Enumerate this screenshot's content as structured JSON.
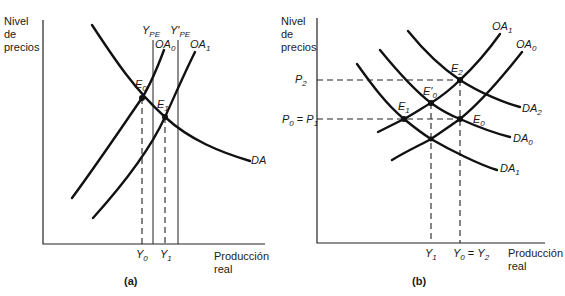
{
  "panel_a": {
    "caption": "(a)",
    "y_axis_label": [
      "Nivel",
      "de",
      "precios"
    ],
    "x_axis_label": [
      "Producción",
      "real"
    ],
    "curves": {
      "DA": "DA",
      "OA0": "OA",
      "OA0_sub": "0",
      "OA1": "OA",
      "OA1_sub": "1"
    },
    "vertical_lines": {
      "YPE": "Y",
      "YPE_sub": "PE",
      "YPE_prime": "Y'",
      "YPE_prime_sub": "PE"
    },
    "points": {
      "E0": "E",
      "E0_sub": "0",
      "E1": "E",
      "E1_sub": "1"
    },
    "x_ticks": {
      "Y0": "Y",
      "Y0_sub": "0",
      "Y1": "Y",
      "Y1_sub": "1"
    }
  },
  "panel_b": {
    "caption": "(b)",
    "y_axis_label": [
      "Nivel",
      "de",
      "precios"
    ],
    "x_axis_label": [
      "Producción",
      "real"
    ],
    "curves": {
      "OA1": "OA",
      "OA1_sub": "1",
      "OA0": "OA",
      "OA0_sub": "0",
      "DA2": "DA",
      "DA2_sub": "2",
      "DA0": "DA",
      "DA0_sub": "0",
      "DA1": "DA",
      "DA1_sub": "1"
    },
    "points": {
      "E2": "E",
      "E2_sub": "2",
      "E0p": "E'",
      "E0p_sub": "0",
      "E1": "E",
      "E1_sub": "1",
      "E0": "E",
      "E0_sub": "0"
    },
    "y_ticks": {
      "P2": "P",
      "P2_sub": "2",
      "P0P1_a": "P",
      "P0P1_a_sub": "0",
      "P0P1_eq": " = ",
      "P0P1_b": "P",
      "P0P1_b_sub": "1"
    },
    "x_ticks": {
      "Y1": "Y",
      "Y1_sub": "1",
      "Y0Y2_a": "Y",
      "Y0Y2_a_sub": "0",
      "Y0Y2_eq": " = ",
      "Y0Y2_b": "Y",
      "Y0Y2_b_sub": "2"
    }
  }
}
